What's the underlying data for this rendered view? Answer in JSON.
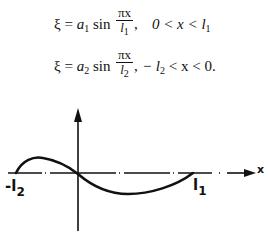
{
  "equations": [
    {
      "lhs": "ξ = ",
      "coef": "a",
      "coef_sub": "1",
      "func": " sin ",
      "frac_num": "πx",
      "frac_den": "l",
      "frac_den_sub": "1",
      "comma": ",",
      "condition": "0 < x < l",
      "condition_sub": "1",
      "condition_tail": ""
    },
    {
      "lhs": "ξ = ",
      "coef": "a",
      "coef_sub": "2",
      "func": " sin ",
      "frac_num": "πx",
      "frac_den": "l",
      "frac_den_sub": "2",
      "comma": ",",
      "condition": "− l",
      "condition_sub": "2",
      "condition_tail": " < x < 0."
    }
  ],
  "diagram": {
    "axis_x_label": "x",
    "left_label": "-l",
    "left_label_sub": "2",
    "right_label": "l",
    "right_label_sub": "1",
    "colors": {
      "stroke": "#111111",
      "background": "#ffffff"
    }
  }
}
